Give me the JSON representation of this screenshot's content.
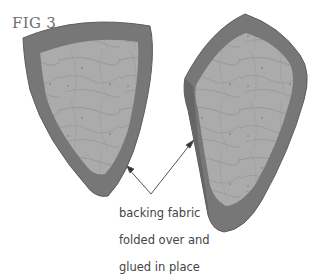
{
  "figure": {
    "label": "FIG 3",
    "caption_lines": [
      "backing fabric",
      "folded over and",
      "glued in place"
    ],
    "colors": {
      "border": "#777777",
      "border_edge": "#5e5e5e",
      "fabric": "#aaaaaa",
      "fabric_texture": "#858585",
      "arrow": "#555555",
      "text": "#444444"
    }
  }
}
